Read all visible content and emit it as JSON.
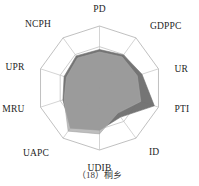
{
  "figure": {
    "caption": "（18）桐乡",
    "caption_number": "18",
    "caption_name": "桐乡"
  },
  "chart_data": {
    "type": "radar",
    "title": "",
    "subtitle": "",
    "xlabel": "",
    "ylabel": "",
    "grid": true,
    "grid_rings": 3,
    "legend_position": "none",
    "axis_range": [
      0,
      1
    ],
    "categories": [
      "PD",
      "GDPPC",
      "UR",
      "PTI",
      "ID",
      "UDIB",
      "UAPC",
      "MRU",
      "UPR",
      "NCPH"
    ],
    "categories_full": [
      "PD",
      "GDPPC",
      "UR",
      "PTI",
      "ID",
      "UDIB",
      "UAPC",
      "MRU",
      "UPR",
      "NCPH"
    ],
    "series": [
      {
        "name": "series-1",
        "color": "#6e6e6e",
        "values": [
          0.62,
          0.66,
          0.72,
          0.93,
          0.58,
          0.68,
          0.8,
          0.62,
          0.6,
          0.64
        ]
      },
      {
        "name": "series-2",
        "color": "#a8a8a8",
        "values": [
          0.58,
          0.62,
          0.64,
          0.7,
          0.5,
          0.74,
          0.86,
          0.6,
          0.56,
          0.6
        ]
      }
    ],
    "colors": {
      "series_1_fill": "#6e6e6e",
      "series_2_fill": "#a8a8a8",
      "grid_line": "#b9b9b9",
      "spoke_line": "#c2c2c2",
      "background": "#ffffff",
      "label_text": "#1e1e1e"
    }
  },
  "labels": {
    "pd": "PD",
    "gdppc": "GDPPC",
    "ur": "UR",
    "pti": "PTI",
    "id": "ID",
    "udib": "UDIB",
    "uapc": "UAPC",
    "mru": "MRU",
    "upr": "UPR",
    "ncph": "NCPH"
  }
}
